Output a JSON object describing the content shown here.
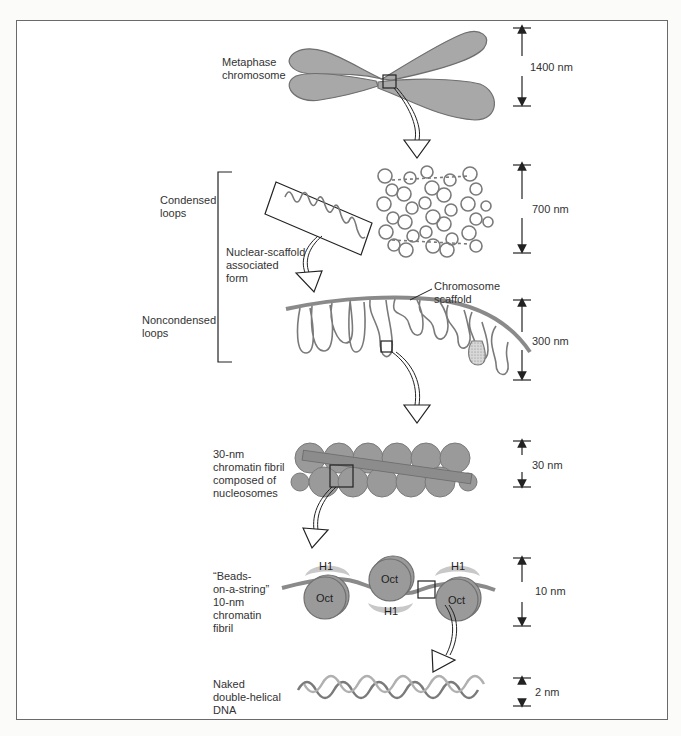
{
  "figure": {
    "colors": {
      "fill": "#a8a8a8",
      "fill_dark": "#8c8c8c",
      "stroke": "#6f6f6f",
      "h1": "#c8c8c8",
      "dna_strand_a": "#7a7a7a",
      "dna_strand_b": "#b0b0b0",
      "frame": "#6a6a6a",
      "text": "#333333"
    },
    "levels": [
      {
        "id": "metaphase",
        "label": "Metaphase\nchromosome",
        "scale": "1400 nm"
      },
      {
        "id": "condensed",
        "label": "Condensed\nloops",
        "scale": "700 nm"
      },
      {
        "id": "noncondensed",
        "label": "Noncondensed\nloops",
        "scale": "300 nm"
      },
      {
        "id": "fibril30",
        "label": "30-nm\nchromatin fibril\ncomposed of\nnucleosomes",
        "scale": "30 nm"
      },
      {
        "id": "beads",
        "label": "“Beads-\non-a-string”\n10-nm\nchromatin\nfibril",
        "scale": "10 nm"
      },
      {
        "id": "dna",
        "label": "Naked\ndouble-helical\nDNA",
        "scale": "2 nm"
      }
    ],
    "annotations": {
      "nuclear_scaffold": "Nuclear-scaffold\nassociated\nform",
      "chromosome_scaffold": "Chromosome\nscaffold"
    },
    "nucleosome_labels": {
      "octamer": "Oct",
      "histone_h1": "H1"
    }
  }
}
